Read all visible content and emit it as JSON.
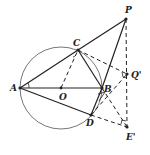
{
  "diagram": {
    "type": "geometry",
    "colors": {
      "stroke": "#222222",
      "circle": "#777777",
      "background": "#ffffff"
    },
    "circle": {
      "center": "O",
      "through": [
        "A",
        "B",
        "C",
        "D"
      ]
    },
    "points": {
      "A": {
        "label": "A",
        "x": 20,
        "y": 88
      },
      "O": {
        "label": "O",
        "x": 61,
        "y": 88
      },
      "B": {
        "label": "B",
        "x": 102,
        "y": 88
      },
      "C": {
        "label": "C",
        "x": 78,
        "y": 50
      },
      "D": {
        "label": "D",
        "x": 91,
        "y": 115
      },
      "P": {
        "label": "P",
        "x": 126,
        "y": 19
      },
      "Q": {
        "label": "Q'",
        "x": 127,
        "y": 74
      },
      "E": {
        "label": "E'",
        "x": 127,
        "y": 127
      }
    },
    "solid_segments": [
      "A-C",
      "C-P",
      "A-B",
      "A-D",
      "C-B",
      "B-P",
      "B-D"
    ],
    "dashed_segments": [
      "O-C",
      "C-Q'",
      "P-E'",
      "D-E'",
      "D-Q'",
      "B-E'"
    ]
  }
}
